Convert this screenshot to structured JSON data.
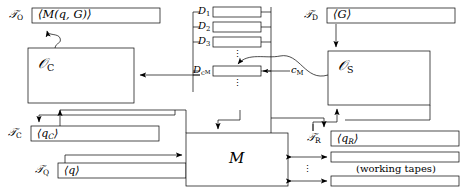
{
  "figure": {
    "type": "block-diagram",
    "background_color": "#ffffff",
    "line_color": "#000000"
  },
  "tapes": {
    "output_tape": {
      "name": "T_O",
      "label": "𝒯",
      "subscript": "O",
      "content": "⟨M(q, G)⟩"
    },
    "description_tape": {
      "name": "T_D",
      "label": "𝒯",
      "subscript": "D",
      "content": "⟨G⟩"
    },
    "control_tape": {
      "name": "T_C",
      "label": "𝒯",
      "subscript": "C",
      "content": "⟨q",
      "content_sub": "C",
      "content_tail": "⟩"
    },
    "query_tape": {
      "name": "T_Q",
      "label": "𝒯",
      "subscript": "Q",
      "content": "⟨q⟩"
    },
    "reply_tape": {
      "name": "T_R",
      "label": "𝒯",
      "subscript": "R",
      "content": "⟨q",
      "content_sub": "R",
      "content_tail": "⟩"
    }
  },
  "machines": {
    "compiler": {
      "name": "O_C",
      "label": "𝒪",
      "subscript": "C"
    },
    "simulator": {
      "name": "O_S",
      "label": "𝒪",
      "subscript": "S"
    },
    "main": {
      "name": "M",
      "label": "M"
    }
  },
  "oracle_boxes": {
    "rows": [
      {
        "label": "D",
        "subscript": "1"
      },
      {
        "label": "D",
        "subscript": "2"
      },
      {
        "label": "D",
        "subscript": "3"
      },
      {
        "label": "D",
        "subscript": "c",
        "subsubscript": "M"
      }
    ],
    "ellipsis_between": "⋮",
    "ellipsis_below": "⋮"
  },
  "annotations": {
    "c_m_label": "c",
    "c_m_subscript": "M",
    "working_tapes_caption": "(working tapes)",
    "working_tapes_ellipsis": "⋮"
  }
}
